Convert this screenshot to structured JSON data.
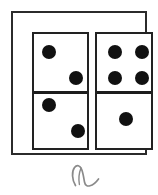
{
  "figure": {
    "type": "line-drawing",
    "background_color": "#ffffff",
    "ink_color": "#111111",
    "frame": {
      "name": "outer-frame",
      "stroke_color": "#2b2b2b",
      "fill_color": "#ffffff"
    },
    "dominoes": [
      {
        "position": "left",
        "stroke_color": "#222222",
        "fill_color": "#ffffff",
        "top_half": {
          "pip_count": 2,
          "pips": [
            {
              "cx": 15,
              "cy": 18
            },
            {
              "cx": 42,
              "cy": 44
            }
          ]
        },
        "bottom_half": {
          "pip_count": 2,
          "pips": [
            {
              "cx": 15,
              "cy": 16
            },
            {
              "cx": 44,
              "cy": 42
            }
          ]
        },
        "total_pips": 4
      },
      {
        "position": "right",
        "stroke_color": "#222222",
        "fill_color": "#ffffff",
        "top_half": {
          "pip_count": 4,
          "pips": [
            {
              "cx": 18,
              "cy": 18
            },
            {
              "cx": 45,
              "cy": 18
            },
            {
              "cx": 18,
              "cy": 44
            },
            {
              "cx": 45,
              "cy": 44
            }
          ]
        },
        "bottom_half": {
          "pip_count": 1,
          "pips": [
            {
              "cx": 29,
              "cy": 30
            }
          ]
        },
        "total_pips": 5
      }
    ],
    "annotation": {
      "text": "a",
      "style": "handwritten-cursive",
      "color": "#8a8a8a"
    }
  }
}
